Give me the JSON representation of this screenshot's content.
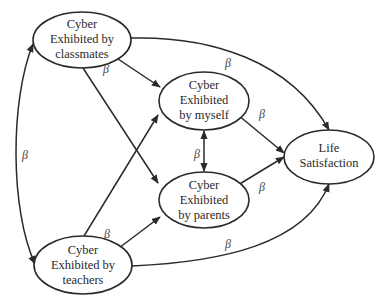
{
  "diagram": {
    "type": "path-model",
    "nodes": [
      {
        "id": "classmates",
        "lines": [
          "Cyber",
          "Exhibited by",
          "classmates"
        ],
        "cx": 82,
        "cy": 40,
        "rx": 49,
        "ry": 28
      },
      {
        "id": "myself",
        "lines": [
          "Cyber",
          "Exhibited",
          "by myself"
        ],
        "cx": 204,
        "cy": 101,
        "rx": 45,
        "ry": 29
      },
      {
        "id": "parents",
        "lines": [
          "Cyber",
          "Exhibited",
          "by parents"
        ],
        "cx": 204,
        "cy": 200,
        "rx": 45,
        "ry": 28
      },
      {
        "id": "teachers",
        "lines": [
          "Cyber",
          "Exhibited by",
          "teachers"
        ],
        "cx": 83,
        "cy": 265,
        "rx": 49,
        "ry": 29
      },
      {
        "id": "life",
        "lines": [
          "Life",
          "Satisfaction"
        ],
        "cx": 329,
        "cy": 157,
        "rx": 45,
        "ry": 27
      }
    ],
    "edges": [
      {
        "from": "classmates",
        "to": "teachers",
        "label": "β",
        "bidirectional": true
      },
      {
        "from": "classmates",
        "to": "myself",
        "label": "β"
      },
      {
        "from": "classmates",
        "to": "parents",
        "label": ""
      },
      {
        "from": "classmates",
        "to": "life",
        "label": "β"
      },
      {
        "from": "teachers",
        "to": "myself",
        "label": "β"
      },
      {
        "from": "teachers",
        "to": "parents",
        "label": ""
      },
      {
        "from": "teachers",
        "to": "life",
        "label": "β"
      },
      {
        "from": "myself",
        "to": "parents",
        "label": "β",
        "bidirectional": true
      },
      {
        "from": "myself",
        "to": "life",
        "label": "β"
      },
      {
        "from": "parents",
        "to": "life",
        "label": "β"
      }
    ],
    "beta_symbol": "β",
    "colors": {
      "stroke": "#2a2a2a",
      "background": "#ffffff",
      "label": "#444444"
    }
  }
}
